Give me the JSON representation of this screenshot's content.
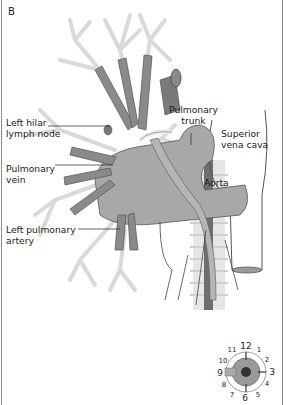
{
  "panel": {
    "label": "B"
  },
  "labels": {
    "left_hilar_lymph_node": [
      "Left hilar",
      "lymph node"
    ],
    "pulmonary_trunk": [
      "Pulmonary",
      "trunk"
    ],
    "superior_vena_cava": [
      "Superior",
      "vena cava"
    ],
    "pulmonary_vein": [
      "Pulmonary",
      "vein"
    ],
    "aorta": [
      "Aorta"
    ],
    "left_pulmonary_artery": [
      "Left pulmonary",
      "artery"
    ]
  },
  "clock_dial": {
    "numbers": [
      "12",
      "1",
      "2",
      "3",
      "4",
      "5",
      "6",
      "7",
      "8",
      "9",
      "10",
      "11"
    ],
    "indicator_position": "9"
  },
  "colors": {
    "vessel_dark": "#7a7a7a",
    "vessel_mid": "#9a9a9a",
    "bronchus_light": "#d6d6d6",
    "outline": "#444444",
    "border": "#8a8a8a"
  }
}
